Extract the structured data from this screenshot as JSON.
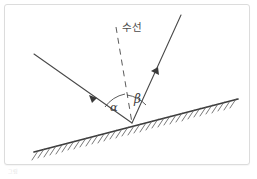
{
  "figure": {
    "kind": "physics-reflection-diagram",
    "background_color": "#ffffff",
    "frame_border_color": "#dcdcdc",
    "ink_color": "#4a4a4a",
    "surface_color": "#3c3c3c",
    "caption_text": "그림"
  },
  "labels": {
    "normal_line": "수선",
    "angle_of_incidence": "α",
    "angle_of_reflection": "β"
  },
  "geometry": {
    "vertex": {
      "x": 131,
      "y": 122
    },
    "incident_ray": {
      "x1": 33,
      "y1": 53,
      "x2": 131,
      "y2": 122,
      "arrow_at": 0.62
    },
    "reflected_ray": {
      "x1": 131,
      "y1": 122,
      "x2": 180,
      "y2": 14,
      "arrow_at": 0.52
    },
    "normal_dashed": {
      "x1": 115,
      "y1": 26,
      "x2": 131,
      "y2": 122
    },
    "surface": {
      "x1": 33,
      "y1": 150,
      "x2": 237,
      "y2": 97
    },
    "hatch_count": 34,
    "alpha_arc_label_pos": {
      "x": 113,
      "y": 106
    },
    "beta_arc_label_pos": {
      "x": 136,
      "y": 99
    },
    "normal_label_pos": {
      "x": 120,
      "y": 26
    }
  }
}
